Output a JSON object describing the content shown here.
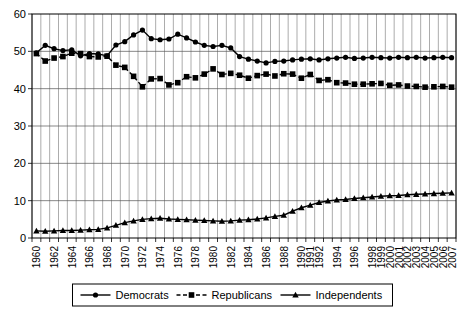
{
  "chart_data": {
    "type": "line",
    "title": "",
    "subtitle": "",
    "xlabel": "",
    "ylabel": "",
    "ylim": [
      0,
      60
    ],
    "yticks": [
      0,
      10,
      20,
      30,
      40,
      50,
      60
    ],
    "grid": true,
    "legend_position": "bottom",
    "x": [
      "1960",
      "1961",
      "1962",
      "1963",
      "1964",
      "1965",
      "1966",
      "1967",
      "1968",
      "1969",
      "1970",
      "1971",
      "1972",
      "1973",
      "1974",
      "1975",
      "1976",
      "1977",
      "1978",
      "1979",
      "1980",
      "1981",
      "1982",
      "1983",
      "1984",
      "1985",
      "1986",
      "1987",
      "1988",
      "1989",
      "1990",
      "1991",
      "1992",
      "1993",
      "1994",
      "1995",
      "1996",
      "1997",
      "1998",
      "1999",
      "2000",
      "2001",
      "2002",
      "2003",
      "2004",
      "2005",
      "2006",
      "2007"
    ],
    "xticklabels": [
      "1960",
      "",
      "1962",
      "",
      "1964",
      "",
      "1966",
      "",
      "1968",
      "",
      "1970",
      "",
      "1972",
      "",
      "1974",
      "",
      "1976",
      "",
      "1978",
      "",
      "1980",
      "",
      "1982",
      "",
      "1984",
      "",
      "1986",
      "",
      "1988",
      "",
      "1990",
      "1991",
      "1992",
      "",
      "1994",
      "",
      "1996",
      "",
      "1998",
      "1999",
      "2000",
      "2001",
      "2002",
      "2003",
      "2004",
      "2005",
      "2006",
      "2007"
    ],
    "series": [
      {
        "name": "Democrats",
        "marker": "circle",
        "linestyle": "solid",
        "color": "#000000",
        "values": [
          49.6,
          51.6,
          50.7,
          50.2,
          50.4,
          48.8,
          49.4,
          49.3,
          48.8,
          51.7,
          52.6,
          54.4,
          55.7,
          53.4,
          53.1,
          53.3,
          54.6,
          53.6,
          52.5,
          51.6,
          51.3,
          51.6,
          50.9,
          48.6,
          47.9,
          47.4,
          46.9,
          47.3,
          47.4,
          47.7,
          47.9,
          48.0,
          47.7,
          48.0,
          48.2,
          48.4,
          48.1,
          48.2,
          48.4,
          48.3,
          48.2,
          48.4,
          48.3,
          48.4,
          48.2,
          48.3,
          48.4,
          48.3
        ]
      },
      {
        "name": "Republicans",
        "marker": "square",
        "linestyle": "dashed",
        "color": "#000000",
        "values": [
          49.4,
          47.4,
          48.2,
          48.6,
          49.5,
          49.4,
          48.6,
          48.5,
          48.7,
          46.3,
          45.7,
          43.3,
          40.5,
          42.6,
          42.7,
          41.0,
          41.6,
          43.2,
          42.9,
          43.9,
          45.3,
          43.8,
          44.1,
          43.6,
          42.8,
          43.5,
          43.9,
          43.4,
          44.0,
          43.9,
          42.8,
          43.8,
          42.2,
          42.4,
          41.6,
          41.5,
          41.2,
          41.2,
          41.3,
          41.4,
          40.9,
          41.0,
          40.7,
          40.6,
          40.4,
          40.5,
          40.6,
          40.4
        ]
      },
      {
        "name": "Independents",
        "marker": "triangle",
        "linestyle": "solid",
        "color": "#000000",
        "values": [
          1.9,
          1.8,
          1.9,
          2.0,
          2.0,
          2.1,
          2.2,
          2.3,
          2.7,
          3.4,
          4.1,
          4.6,
          5.0,
          5.2,
          5.3,
          5.1,
          5.0,
          4.9,
          4.8,
          4.7,
          4.6,
          4.5,
          4.6,
          4.8,
          4.9,
          5.1,
          5.4,
          5.8,
          6.1,
          7.2,
          8.1,
          8.8,
          9.5,
          9.9,
          10.2,
          10.3,
          10.6,
          10.8,
          11.0,
          11.2,
          11.3,
          11.4,
          11.6,
          11.7,
          11.8,
          11.9,
          12.0,
          12.1
        ]
      }
    ],
    "legend": [
      {
        "label": "Democrats",
        "marker": "circle",
        "linestyle": "solid"
      },
      {
        "label": "Republicans",
        "marker": "square",
        "linestyle": "dashed"
      },
      {
        "label": "Independents",
        "marker": "triangle",
        "linestyle": "solid"
      }
    ]
  }
}
